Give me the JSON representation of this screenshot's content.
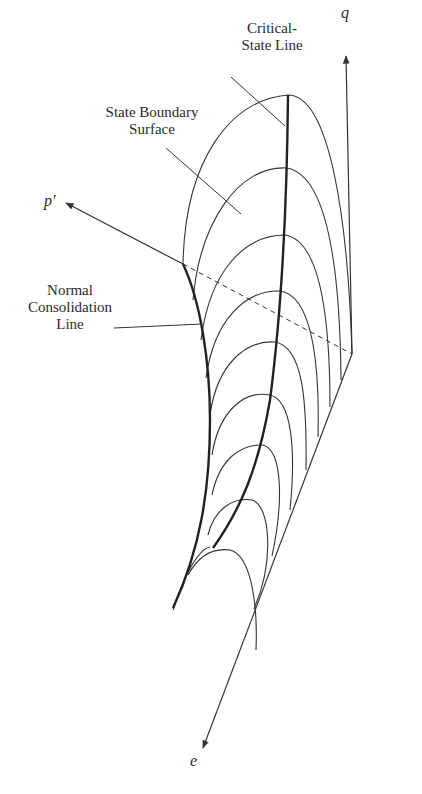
{
  "diagram": {
    "axes": {
      "q": {
        "label": "q"
      },
      "p": {
        "label": "p′"
      },
      "e": {
        "label": "e"
      }
    },
    "labels": {
      "critical_state_line": "Critical-\nState Line",
      "state_boundary_surface": "State Boundary\nSurface",
      "normal_consolidation_line": "Normal\nConsolidation\nLine"
    },
    "colors": {
      "line": "#333333",
      "background": "#ffffff"
    }
  }
}
